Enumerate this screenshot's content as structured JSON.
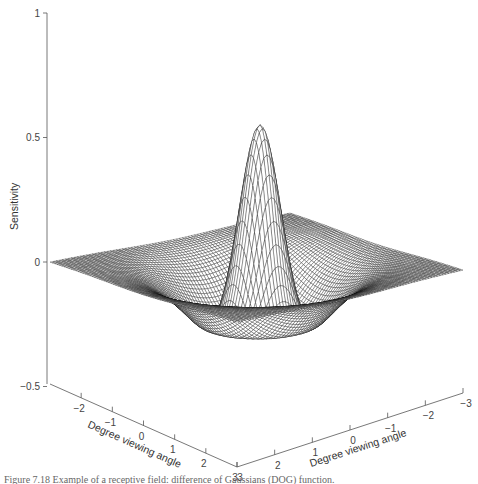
{
  "chart_data": {
    "type": "surface",
    "title": "",
    "function": "difference of Gaussians (DOG)",
    "zlabel": "Sensitivity",
    "xlabel": "Degree viewing angle",
    "ylabel": "Degree viewing angle",
    "z_ticks": [
      "1",
      "0.5",
      "0",
      "-0.5"
    ],
    "z_tick_values": [
      1,
      0.5,
      0,
      -0.5
    ],
    "x_ticks": [
      "-2",
      "-1",
      "0",
      "1",
      "2",
      "3"
    ],
    "y_ticks": [
      "3",
      "2",
      "1",
      "0",
      "-1",
      "-2",
      "-3"
    ],
    "xlim": [
      -3,
      3
    ],
    "ylim": [
      -3,
      3
    ],
    "zlim": [
      -0.5,
      1
    ],
    "peak_value": 0.57,
    "trough_value": -0.12,
    "center_sigma": 0.45,
    "surround_sigma": 1.1,
    "grid_lines": 80,
    "grid": false,
    "mesh_color": "#111111",
    "surface_fill": "#ffffff"
  },
  "caption": "Figure 7.18  Example of a receptive field: difference of Gaussians (DOG) function."
}
